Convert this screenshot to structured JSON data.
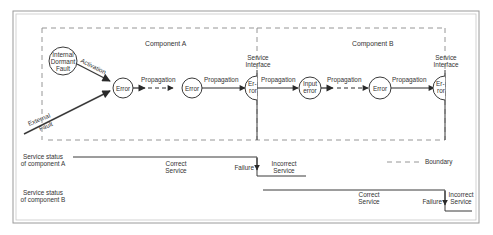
{
  "diagram": {
    "components": [
      {
        "label": "Component A"
      },
      {
        "label": "Component B"
      }
    ],
    "nodes": {
      "internal_fault": [
        "Internal",
        "Dormant",
        "Fault"
      ],
      "error_a1": "Error",
      "error_a2": "Error",
      "interface_error_a": [
        "Er-",
        "ror"
      ],
      "input_error_b": [
        "Input",
        "error"
      ],
      "error_b1": "Error",
      "interface_error_b": [
        "Er-",
        "ror"
      ]
    },
    "edges": {
      "activation": "Activation",
      "external_fault": [
        "External",
        "Fault"
      ],
      "propagation": "Propagation"
    },
    "service_interface": [
      "Service",
      "Interface"
    ],
    "status_rows": [
      {
        "label": [
          "Service status",
          "of component A"
        ],
        "correct": [
          "Correct",
          "Service"
        ],
        "failure": "Failure",
        "incorrect": [
          "Incorrect",
          "Service"
        ]
      },
      {
        "label": [
          "Service status",
          "of component B"
        ],
        "correct": [
          "Correct",
          "Service"
        ],
        "failure": "Failure",
        "incorrect": [
          "Incorrect",
          "Service"
        ]
      }
    ],
    "legend": {
      "boundary": "Boundary"
    }
  }
}
